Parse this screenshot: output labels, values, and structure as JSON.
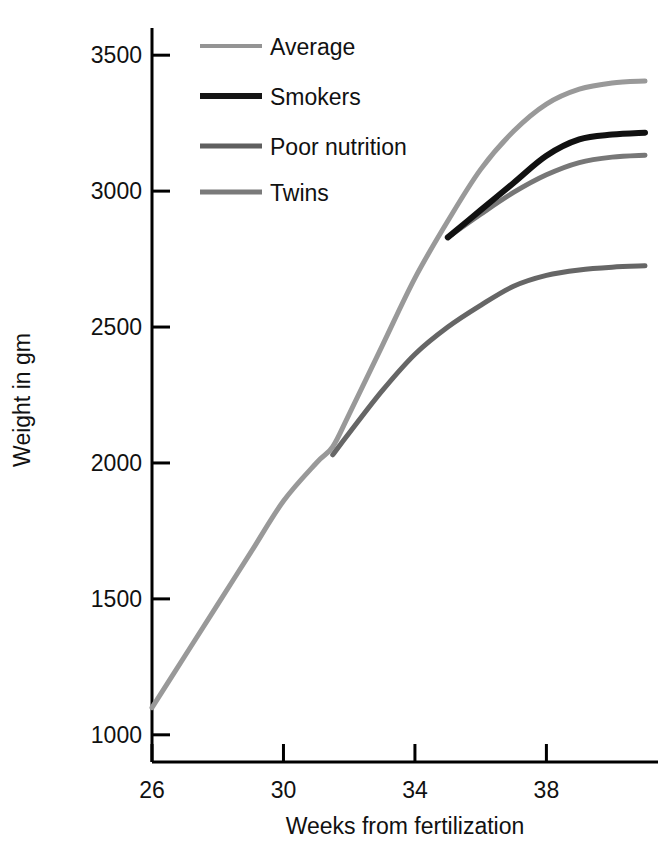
{
  "chart_data": {
    "type": "line",
    "title": "",
    "xlabel": "Weeks from fertilization",
    "ylabel": "Weight in gm",
    "xlim": [
      26,
      41
    ],
    "ylim": [
      900,
      3600
    ],
    "xticks": [
      26,
      30,
      34,
      38
    ],
    "yticks": [
      1000,
      1500,
      2000,
      2500,
      3000,
      3500
    ],
    "xtick_labels": [
      "26",
      "30",
      "34",
      "38"
    ],
    "ytick_labels": [
      "1000",
      "1500",
      "2000",
      "2500",
      "3000",
      "3500"
    ],
    "grid": false,
    "legend_position": "top-left-inside",
    "series": [
      {
        "name": "Average",
        "color": "#999999",
        "width": 5,
        "x": [
          26,
          27,
          28,
          29,
          30,
          31,
          31.5,
          32,
          33,
          34,
          35,
          36,
          37,
          38,
          39,
          40,
          41
        ],
        "y": [
          1100,
          1290,
          1480,
          1670,
          1860,
          2000,
          2060,
          2180,
          2430,
          2680,
          2890,
          3080,
          3220,
          3320,
          3375,
          3398,
          3405
        ]
      },
      {
        "name": "Smokers",
        "color": "#111111",
        "width": 6,
        "x": [
          35,
          36,
          37,
          38,
          39,
          40,
          41
        ],
        "y": [
          2830,
          2930,
          3030,
          3130,
          3190,
          3208,
          3215
        ]
      },
      {
        "name": "Poor nutrition",
        "color": "#666666",
        "width": 5,
        "x": [
          31.5,
          32,
          33,
          34,
          35,
          36,
          37,
          38,
          39,
          40,
          41
        ],
        "y": [
          2030,
          2110,
          2265,
          2400,
          2500,
          2580,
          2650,
          2690,
          2710,
          2720,
          2725
        ]
      },
      {
        "name": "Twins",
        "color": "#777777",
        "width": 5,
        "x": [
          35,
          36,
          37,
          38,
          39,
          40,
          41
        ],
        "y": [
          2830,
          2915,
          2995,
          3060,
          3105,
          3125,
          3132
        ]
      }
    ]
  },
  "legend": {
    "items": [
      {
        "label": "Average",
        "color": "#949494",
        "thickness": 4
      },
      {
        "label": "Smokers",
        "color": "#151515",
        "thickness": 6
      },
      {
        "label": "Poor nutrition",
        "color": "#5f5f5f",
        "thickness": 5
      },
      {
        "label": "Twins",
        "color": "#7a7a7a",
        "thickness": 5
      }
    ]
  },
  "axes": {
    "x_title": "Weeks from fertilization",
    "y_title": "Weight in gm",
    "axis_color": "#000000"
  }
}
